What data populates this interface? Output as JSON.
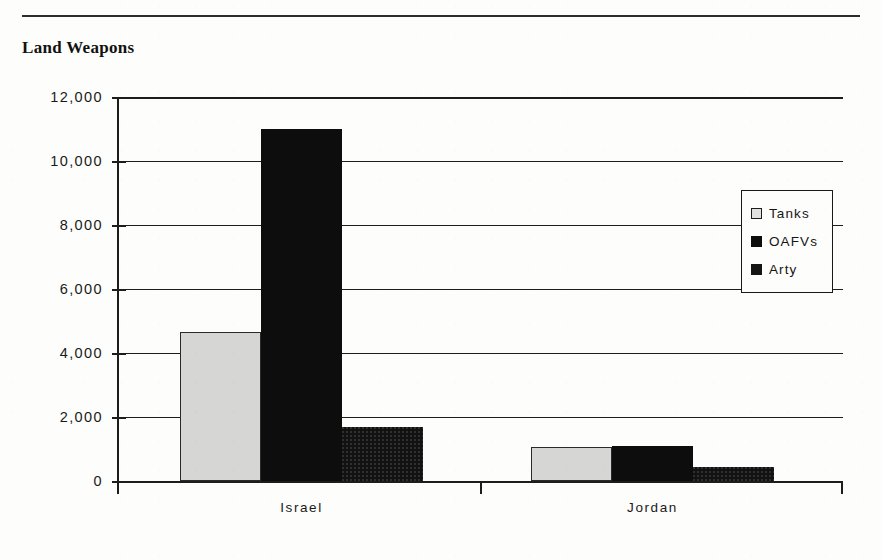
{
  "document": {
    "title": "Land Weapons",
    "rule_visible": true
  },
  "chart_data": {
    "type": "bar",
    "title": "Land Weapons",
    "xlabel": "",
    "ylabel": "",
    "categories": [
      "Israel",
      "Jordan"
    ],
    "series": [
      {
        "name": "Tanks",
        "values": [
          4650,
          1050
        ],
        "color": "#d6d6d4"
      },
      {
        "name": "OAFVs",
        "values": [
          11000,
          1100
        ],
        "color": "#0d0d0d"
      },
      {
        "name": "Arty",
        "values": [
          1700,
          450
        ],
        "color": "#121212"
      }
    ],
    "ylim": [
      0,
      12000
    ],
    "ytick_values": [
      0,
      2000,
      4000,
      6000,
      8000,
      10000,
      12000
    ],
    "ytick_labels": [
      "0",
      "2,000",
      "4,000",
      "6,000",
      "8,000",
      "10,000",
      "12,000"
    ],
    "grid": true,
    "legend_position": "upper right",
    "legend_entries": [
      "Tanks",
      "OAFVs",
      "Arty"
    ]
  }
}
